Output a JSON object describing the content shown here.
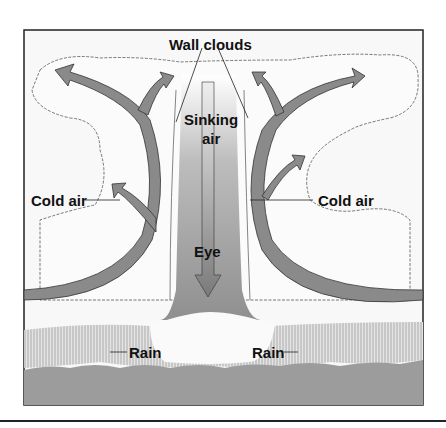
{
  "figure": {
    "labels": {
      "wall_clouds": "Wall clouds",
      "sinking_air_1": "Sinking",
      "sinking_air_2": "air",
      "cold_air_left": "Cold air",
      "cold_air_right": "Cold air",
      "eye": "Eye",
      "rain_left": "Rain",
      "rain_right": "Rain"
    },
    "colors": {
      "frame": "#222222",
      "arrow_fill": "#8a8a8a",
      "eye_column": "#9a9a9a",
      "ocean": "#9c9c9c",
      "cloud_fill": "#f7f7f7",
      "rain_fill": "#d8d8d8"
    }
  }
}
